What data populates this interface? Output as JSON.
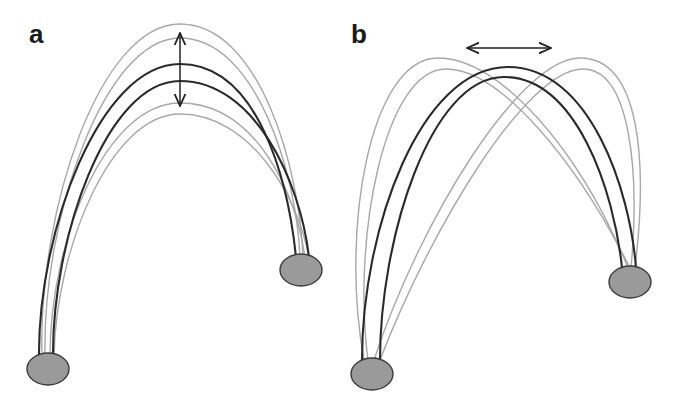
{
  "figure": {
    "panels": [
      {
        "label": "a",
        "description": "Arch with fixed footpoints; apex height varies (vertical double arrow)",
        "arrow": "vertical-double-arrow",
        "footpoints": [
          {
            "cx": 48,
            "cy": 369,
            "rx": 21,
            "ry": 16
          },
          {
            "cx": 301,
            "cy": 270,
            "rx": 21,
            "ry": 16
          }
        ],
        "arcs": [
          {
            "style": "gray",
            "apex_y": 24,
            "left_x": 41,
            "right_x": 303
          },
          {
            "style": "gray",
            "apex_y": 38,
            "left_x": 44,
            "right_x": 300
          },
          {
            "style": "dark",
            "apex_y": 64,
            "left_x": 39,
            "right_x": 296
          },
          {
            "style": "dark",
            "apex_y": 81,
            "left_x": 53,
            "right_x": 309
          },
          {
            "style": "gray",
            "apex_y": 103,
            "left_x": 50,
            "right_x": 305
          },
          {
            "style": "gray",
            "apex_y": 114,
            "left_x": 54,
            "right_x": 309
          }
        ]
      },
      {
        "label": "b",
        "description": "Arch with fixed footpoints; apex shifts horizontally (horizontal double arrow)",
        "arrow": "horizontal-double-arrow",
        "footpoints": [
          {
            "cx": 372,
            "cy": 374,
            "rx": 21,
            "ry": 16
          },
          {
            "cx": 630,
            "cy": 282,
            "rx": 21,
            "ry": 16
          }
        ],
        "arcs": [
          {
            "style": "gray",
            "apex_x": 438,
            "apex_y": 58
          },
          {
            "style": "gray",
            "apex_x": 446,
            "apex_y": 69
          },
          {
            "style": "dark",
            "apex_x": 508,
            "apex_y": 67
          },
          {
            "style": "dark",
            "apex_x": 504,
            "apex_y": 77
          },
          {
            "style": "gray",
            "apex_x": 580,
            "apex_y": 58
          },
          {
            "style": "gray",
            "apex_x": 583,
            "apex_y": 69
          }
        ]
      }
    ],
    "colors": {
      "dark_arc": "#2a2a2a",
      "gray_arc": "#a8a8a8",
      "footpoint_fill": "#9a9a9a",
      "footpoint_stroke": "#3a3a3a",
      "arrow": "#222222",
      "background": "#ffffff"
    }
  }
}
